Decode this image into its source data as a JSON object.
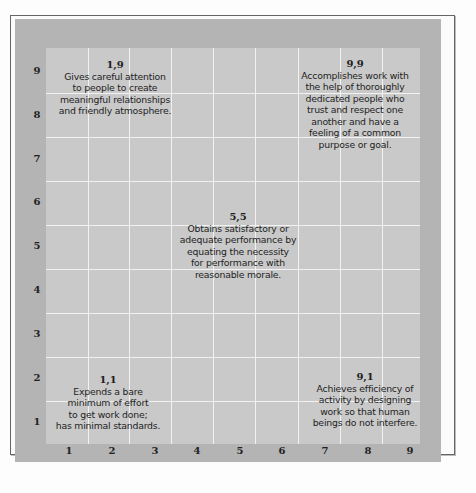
{
  "grid": {
    "x_ticks": [
      "1",
      "2",
      "3",
      "4",
      "5",
      "6",
      "7",
      "8",
      "9"
    ],
    "y_ticks": [
      "9",
      "8",
      "7",
      "6",
      "5",
      "4",
      "3",
      "2",
      "1"
    ],
    "colors": {
      "mat": "#b4b4b4",
      "grid_background": "#c9c9c9",
      "grid_lines": "#f2f2f2",
      "text": "#1e1e1e"
    }
  },
  "styles": {
    "s19": {
      "coord": "1,9",
      "description": "Gives careful attention\nto people to create\nmeaningful relationships\nand friendly atmosphere."
    },
    "s99": {
      "coord": "9,9",
      "description": "Accomplishes work with\nthe help of thoroughly\ndedicated people who\ntrust and respect one\nanother and have a\nfeeling of a common\npurpose or goal."
    },
    "s55": {
      "coord": "5,5",
      "description": "Obtains satisfactory or\nadequate performance by\nequating the necessity\nfor performance with\nreasonable morale."
    },
    "s11": {
      "coord": "1,1",
      "description": "Expends a bare\nminimum of effort\nto get work done;\nhas minimal standards."
    },
    "s91": {
      "coord": "9,1",
      "description": "Achieves efficiency of\nactivity by designing\nwork so that human\nbeings do not interfere."
    }
  }
}
